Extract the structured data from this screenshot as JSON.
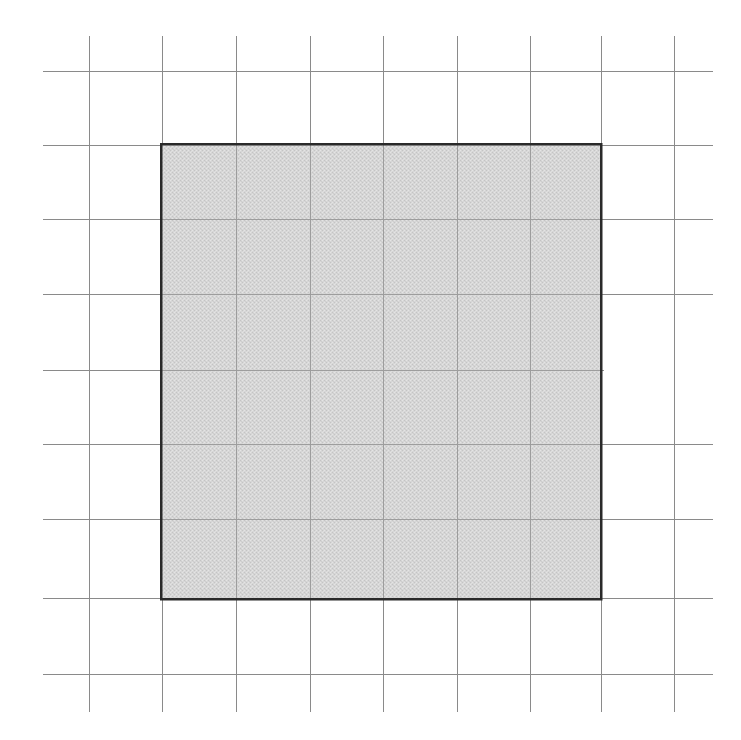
{
  "figure": {
    "width": 741,
    "height": 740,
    "background_color": "#ffffff"
  },
  "colors": {
    "grid_line": "#8a8a8a",
    "grid_line_faded": "#c9c9c9",
    "square_border": "#2a2a2a",
    "square_fill": "#d2d2d2",
    "square_fill_dither_light": "#e2e2e2",
    "square_fill_dither_dark": "#c2c2c2",
    "page_background": "#ffffff"
  },
  "grid": {
    "label": "square-lattice-grid",
    "cell_size_px": 73.6,
    "line_width_px": 1,
    "columns": 8,
    "rows": 8,
    "vertical_line_x": [
      89,
      162,
      236,
      310,
      383,
      457,
      530,
      601,
      674
    ],
    "horizontal_line_y": [
      71,
      145,
      219,
      294,
      370,
      444,
      519,
      598,
      674
    ],
    "vertical_extent_y": [
      36,
      712
    ],
    "horizontal_extent_x": [
      43,
      713
    ],
    "faded_segment": {
      "note": "horizontal line y=370 fades to white right of x=650",
      "y": 370,
      "fade_start_x": 604,
      "fade_end_x": 713
    }
  },
  "shaded_square": {
    "label": "shaded-square",
    "x": 161,
    "y": 144,
    "width": 440,
    "height": 455,
    "border_width_px": 2.5,
    "spans_columns": 6,
    "spans_rows": 6,
    "corner_top_left": [
      161,
      144
    ],
    "corner_top_right": [
      601,
      144
    ],
    "corner_bottom_right": [
      601,
      599
    ],
    "corner_bottom_left": [
      161,
      599
    ]
  },
  "chart_data": {
    "type": "scatter",
    "subtitle": "",
    "xlabel": "",
    "ylabel": "",
    "grid": true,
    "legend": "none",
    "xlim": [
      0,
      9
    ],
    "ylim": [
      0,
      9
    ],
    "xticks": [
      0,
      1,
      2,
      3,
      4,
      5,
      6,
      7,
      8
    ],
    "yticks": [
      0,
      1,
      2,
      3,
      4,
      5,
      6,
      7,
      8
    ],
    "xtick_labels": [
      "",
      "",
      "",
      "",
      "",
      "",
      "",
      "",
      ""
    ],
    "ytick_labels": [
      "",
      "",
      "",
      "",
      "",
      "",
      "",
      "",
      ""
    ],
    "annotations": [],
    "series": [
      {
        "name": "shaded-square",
        "kind": "rectangle",
        "x": 1,
        "y": 1,
        "width": 6,
        "height": 6,
        "fill": "#d2d2d2",
        "edge": "#2a2a2a"
      }
    ]
  }
}
